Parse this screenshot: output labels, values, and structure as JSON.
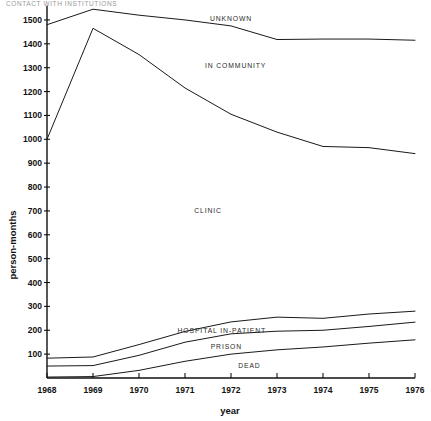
{
  "caption": {
    "text": "CONTACT WITH INSTITUTIONS"
  },
  "chart_data": {
    "type": "area",
    "title": "",
    "subtitle": "",
    "xlabel": "year",
    "ylabel": "person-months",
    "categories": [
      1968,
      1969,
      1970,
      1971,
      1972,
      1973,
      1974,
      1975,
      1976
    ],
    "x_tick_labels": [
      "1968",
      "1969",
      "1970",
      "1971",
      "1972",
      "1973",
      "1974",
      "1975",
      "1976"
    ],
    "y_tick_labels": [
      "100",
      "200",
      "300",
      "400",
      "500",
      "600",
      "700",
      "800",
      "900",
      "1000",
      "1100",
      "1200",
      "1300",
      "1400",
      "1500"
    ],
    "y_tick_values": [
      100,
      200,
      300,
      400,
      500,
      600,
      700,
      800,
      900,
      1000,
      1100,
      1200,
      1300,
      1400,
      1500
    ],
    "xlim": [
      1968,
      1976
    ],
    "ylim": [
      0,
      1560
    ],
    "grid": false,
    "legend": "inline-band-labels",
    "stacking": "cumulative-boundaries",
    "boundaries": [
      {
        "name": "unknown-upper-boundary",
        "label": "UNKNOWN",
        "label_x": 1972.0,
        "label_y": 1495,
        "values": [
          1480,
          1545,
          1520,
          1500,
          1475,
          1418,
          1420,
          1420,
          1415
        ]
      },
      {
        "name": "in-community-upper-boundary",
        "label": "IN COMMUNITY",
        "label_x": 1972.1,
        "label_y": 1297,
        "values": [
          1000,
          1465,
          1355,
          1215,
          1105,
          1030,
          970,
          965,
          940
        ]
      },
      {
        "name": "clinic-upper-boundary",
        "label": "CLINIC",
        "label_x": 1971.5,
        "label_y": 690,
        "values": [
          83,
          88,
          140,
          195,
          235,
          255,
          250,
          268,
          280
        ]
      },
      {
        "name": "hospital-in-patient-upper-boundary",
        "label": "HOSPITAL IN-PATIENT",
        "label_x": 1971.8,
        "label_y": 190,
        "values": [
          50,
          52,
          95,
          150,
          185,
          196,
          200,
          216,
          234
        ]
      },
      {
        "name": "prison-upper-boundary",
        "label": "PRISON",
        "label_x": 1971.9,
        "label_y": 120,
        "values": [
          4,
          6,
          32,
          70,
          100,
          118,
          130,
          146,
          160
        ]
      },
      {
        "name": "dead-baseline-region",
        "label": "DEAD",
        "label_x": 1972.4,
        "label_y": 42,
        "values": [
          0,
          0,
          0,
          0,
          0,
          0,
          0,
          0,
          0
        ]
      }
    ],
    "band_labels": [
      "UNKNOWN",
      "IN COMMUNITY",
      "CLINIC",
      "HOSPITAL IN-PATIENT",
      "PRISON",
      "DEAD"
    ],
    "colors": {
      "line": "#1a1a1a",
      "axis": "#111111",
      "text": "#111111",
      "band_label": "#2a2a2a",
      "background": "#ffffff"
    }
  }
}
